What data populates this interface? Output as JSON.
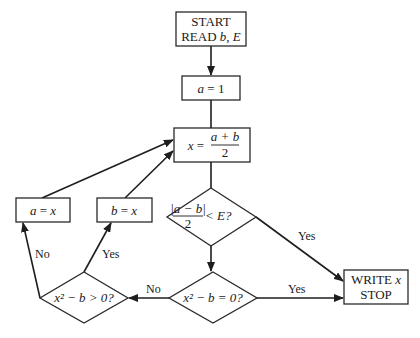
{
  "flowchart": {
    "start": {
      "line1": "START",
      "line2_prefix": "READ ",
      "line2_b": "b",
      "line2_sep": ",  ",
      "line2_e": "E"
    },
    "init": {
      "var": "a",
      "eq": " = 1"
    },
    "midpoint": {
      "lhs": "x",
      "eq": " = ",
      "numerator": "a + b",
      "denominator": "2"
    },
    "decision_tolerance": {
      "numerator": "|a − b|",
      "denominator": "2",
      "rest": "< E?"
    },
    "assign_a": {
      "text_a": "a",
      "eq": " = ",
      "text_x": "x"
    },
    "assign_b": {
      "text_b": "b",
      "eq": " = ",
      "text_x": "x"
    },
    "decision_root": {
      "text": "x² − b = 0?"
    },
    "decision_sign": {
      "text": "x² − b > 0?"
    },
    "output": {
      "line1_prefix": "WRITE ",
      "line1_var": "x",
      "line2": "STOP"
    },
    "edge_labels": {
      "tolerance_yes": "Yes",
      "root_yes": "Yes",
      "root_no": "No",
      "sign_yes": "Yes",
      "sign_no": "No"
    }
  }
}
